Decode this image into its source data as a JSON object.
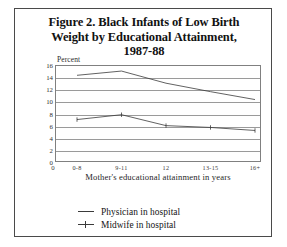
{
  "figure": {
    "title_lines": [
      "Figure 2. Black Infants of Low Birth",
      "Weight by Educational Attainment,",
      "1987-88"
    ]
  },
  "chart_data": {
    "type": "line",
    "title": "Figure 2. Black Infants of Low Birth Weight by Educational Attainment, 1987-88",
    "xlabel": "Mother's educational attainment in years",
    "ylabel": "Percent",
    "categories": [
      "0-8",
      "9-11",
      "12",
      "13-15",
      "16+"
    ],
    "x_origin_label": "0",
    "ylim": [
      0,
      16
    ],
    "yticks": [
      0,
      2,
      4,
      6,
      8,
      10,
      12,
      14,
      16
    ],
    "grid": true,
    "legend_position": "below-plot",
    "series": [
      {
        "name": "Physician in hospital",
        "values": [
          14.3,
          15.0,
          13.0,
          11.6,
          10.3
        ],
        "marker": "none"
      },
      {
        "name": "Midwife in hospital",
        "values": [
          7.0,
          7.8,
          6.0,
          5.7,
          5.2
        ],
        "marker": "tick"
      }
    ]
  },
  "colors": {
    "line": "#3a3a3a",
    "grid": "#9a9a9a",
    "frame": "#808080",
    "border": "#4a4a4a",
    "text": "#1a1a1a",
    "background": "#ffffff"
  }
}
